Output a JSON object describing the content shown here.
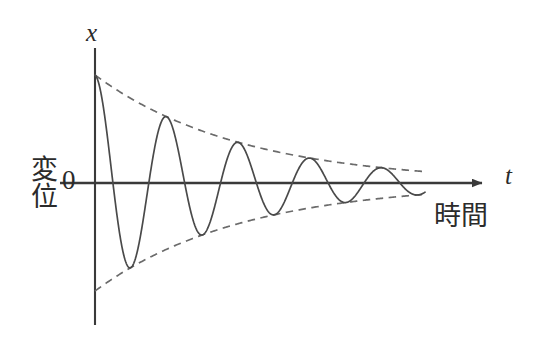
{
  "figure": {
    "title_visible": false,
    "background_color": "#ffffff",
    "axis_color": "#3a3a3a",
    "curve_color": "#4a4a4a",
    "envelope_color": "#6b6b6b",
    "text_color": "#2b2b2b"
  },
  "labels": {
    "y_axis_symbol": "x",
    "x_axis_symbol": "t",
    "origin": "0",
    "y_axis_name": "変位",
    "x_axis_name": "時間"
  },
  "icons": {
    "x_axis_arrow": "arrow-right-icon"
  },
  "chart_data": {
    "type": "line",
    "title": "",
    "xlabel": "時間",
    "ylabel": "変位",
    "x_axis_symbol": "t",
    "y_axis_symbol": "x",
    "grid": false,
    "legend": null,
    "xlim": [
      0,
      1
    ],
    "ylim": [
      -1.1,
      1.1
    ],
    "model": {
      "form": "x(t) = A0 * exp(-lambda * t) * cos(2*pi*t/T)",
      "initial_amplitude": 1.0,
      "decay_constant": 2.25,
      "periods_shown": 4.6,
      "starts_at": "positive maximum"
    },
    "series": [
      {
        "name": "damped-oscillation",
        "style": "solid",
        "color": "#4a4a4a",
        "x": [
          0.0,
          0.022,
          0.043,
          0.065,
          0.087,
          0.109,
          0.13,
          0.152,
          0.174,
          0.196,
          0.217,
          0.239,
          0.261,
          0.283,
          0.304,
          0.326,
          0.348,
          0.37,
          0.391,
          0.413,
          0.435,
          0.457,
          0.478,
          0.5,
          0.522,
          0.543,
          0.565,
          0.587,
          0.609,
          0.63,
          0.652,
          0.674,
          0.696,
          0.717,
          0.739,
          0.761,
          0.783,
          0.804,
          0.826,
          0.848,
          0.87,
          0.891,
          0.913,
          0.935,
          0.957,
          0.978,
          1.0
        ],
        "y": [
          1.0,
          0.78,
          0.27,
          -0.36,
          -0.8,
          -0.89,
          -0.62,
          -0.13,
          0.39,
          0.71,
          0.76,
          0.54,
          0.13,
          -0.3,
          -0.58,
          -0.63,
          -0.44,
          -0.08,
          0.28,
          0.51,
          0.54,
          0.38,
          0.08,
          -0.23,
          -0.43,
          -0.45,
          -0.31,
          -0.05,
          0.2,
          0.36,
          0.38,
          0.26,
          0.05,
          -0.16,
          -0.3,
          -0.32,
          -0.22,
          -0.03,
          0.14,
          0.26,
          0.27,
          0.19,
          0.04,
          -0.12,
          -0.22,
          -0.23,
          -0.15
        ]
      },
      {
        "name": "upper-envelope",
        "style": "dashed",
        "color": "#6b6b6b",
        "x": [
          0.0,
          0.1,
          0.2,
          0.3,
          0.4,
          0.5,
          0.6,
          0.7,
          0.8,
          0.9,
          1.0
        ],
        "y": [
          1.0,
          0.8,
          0.64,
          0.51,
          0.41,
          0.32,
          0.26,
          0.21,
          0.17,
          0.13,
          0.11
        ]
      },
      {
        "name": "lower-envelope",
        "style": "dashed",
        "color": "#6b6b6b",
        "x": [
          0.0,
          0.1,
          0.2,
          0.3,
          0.4,
          0.5,
          0.6,
          0.7,
          0.8,
          0.9,
          1.0
        ],
        "y": [
          -1.0,
          -0.8,
          -0.64,
          -0.51,
          -0.41,
          -0.32,
          -0.26,
          -0.21,
          -0.17,
          -0.13,
          -0.11
        ]
      }
    ]
  }
}
